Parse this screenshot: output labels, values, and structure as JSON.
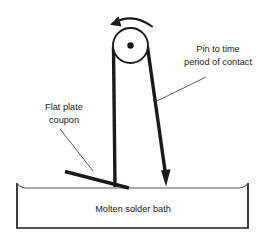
{
  "figure": {
    "background_color": "#ffffff",
    "line_color": "#1a1a1a",
    "thin_line_color": "#555555",
    "text_color": "#1a1a1a"
  },
  "labels": {
    "pin_label_line1": "Pin to time",
    "pin_label_line2": "period of contact",
    "coupon_label_line1": "Flat plate",
    "coupon_label_line2": "coupon",
    "bath_label": "Molten solder bath"
  },
  "parts": {
    "pivot_circle_name": "pivot-wheel",
    "pivot_dot_name": "pivot-center-dot",
    "rotation_arrow_name": "counterclockwise-rotation-arrow",
    "left_arm_name": "left-pendulum-arm",
    "right_arm_name": "right-pendulum-arm-with-pin",
    "coupon_name": "flat-plate-coupon",
    "bath_name": "solder-bath-container",
    "surface_name": "solder-surface-line"
  },
  "geometry": {
    "pivot_center_x": 130.5,
    "pivot_center_y": 45.5,
    "pivot_radius": 17.5,
    "pivot_dot_radius": 3.2,
    "left_arm": {
      "x1": 113.5,
      "y1": 47,
      "x2": 115,
      "y2": 187
    },
    "right_arm": {
      "x1": 147.5,
      "y1": 47,
      "x2": 166,
      "y2": 180
    },
    "coupon": {
      "x1": 65,
      "y1": 171,
      "x2": 129,
      "y2": 188
    },
    "bath": {
      "left": 17,
      "right": 248,
      "top": 183,
      "bottom": 228
    },
    "surface_y": 188,
    "pin_leader": {
      "x1": 157,
      "y1": 101,
      "x2": 206,
      "y2": 77
    },
    "coupon_leader": {
      "x1": 60,
      "y1": 129,
      "x2": 93,
      "y2": 171
    }
  },
  "text_positions": {
    "pin_label_x": 218,
    "pin_label_y1": 52,
    "pin_label_y2": 65,
    "coupon_label_x": 64,
    "coupon_label_y1": 110,
    "coupon_label_y2": 123,
    "bath_label_x": 133,
    "bath_label_y": 212
  }
}
